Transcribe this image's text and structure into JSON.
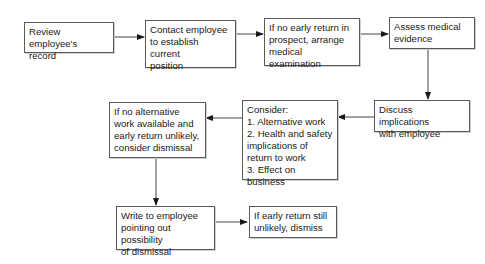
{
  "diagram": {
    "type": "flowchart",
    "nodes": [
      {
        "id": "review",
        "label": "Review employee's\nrecord"
      },
      {
        "id": "contact",
        "label": "Contact employee\nto establish current\nposition"
      },
      {
        "id": "arrange",
        "label": "If no early return in\nprospect, arrange\nmedical examination"
      },
      {
        "id": "assess",
        "label": "Assess medical\nevidence"
      },
      {
        "id": "discuss",
        "label": "Discuss implications\nwith employee"
      },
      {
        "id": "consider",
        "label": "Consider:\n1.  Alternative work\n2. Health and safety\nimplications of\nreturn to work\n3. Effect on business"
      },
      {
        "id": "no_alternative",
        "label": "If no alternative\nwork available and\nearly return unlikely,\nconsider dismissal"
      },
      {
        "id": "write",
        "label": "Write to employee\npointing out possibility\nof dismissal"
      },
      {
        "id": "dismiss",
        "label": "If early return still\nunlikely, dismiss"
      }
    ],
    "edges": [
      {
        "from": "review",
        "to": "contact"
      },
      {
        "from": "contact",
        "to": "arrange"
      },
      {
        "from": "arrange",
        "to": "assess"
      },
      {
        "from": "assess",
        "to": "discuss"
      },
      {
        "from": "discuss",
        "to": "consider"
      },
      {
        "from": "consider",
        "to": "no_alternative"
      },
      {
        "from": "no_alternative",
        "to": "write"
      },
      {
        "from": "write",
        "to": "dismiss"
      }
    ]
  }
}
